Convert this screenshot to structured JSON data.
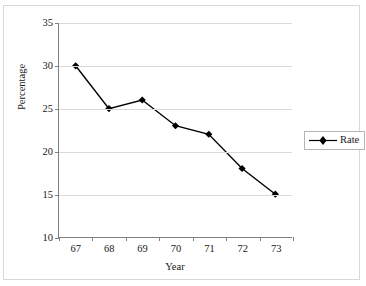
{
  "chart_data": {
    "type": "line",
    "title": "",
    "xlabel": "Year",
    "ylabel": "Percentage",
    "categories": [
      "67",
      "68",
      "69",
      "70",
      "71",
      "72",
      "73"
    ],
    "series": [
      {
        "name": "Rate",
        "values": [
          30,
          25,
          26,
          23,
          22,
          18,
          15
        ],
        "color": "#000000",
        "marker": "diamond"
      }
    ],
    "ylim": [
      10,
      35
    ],
    "yticks": [
      10,
      15,
      20,
      25,
      30,
      35
    ],
    "ytick_labels": [
      "10",
      "15",
      "20",
      "25",
      "30",
      "35"
    ],
    "grid": "horizontal",
    "legend_position": "right",
    "legend_entries": [
      "Rate"
    ]
  }
}
